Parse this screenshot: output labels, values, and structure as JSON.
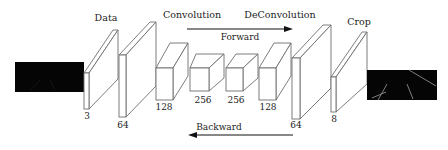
{
  "diagram": {
    "type": "encoder-decoder network architecture",
    "labels": {
      "data": "Data",
      "convolution": "Convolution",
      "deconvolution": "DeConvolution",
      "crop": "Crop"
    },
    "arrows": {
      "forward": "Forward",
      "backward": "Backward"
    },
    "layers": [
      {
        "id": "input-image",
        "kind": "image",
        "label": ""
      },
      {
        "id": "data-layer",
        "kind": "slab",
        "channels": "3"
      },
      {
        "id": "conv1",
        "kind": "slab",
        "channels": "64"
      },
      {
        "id": "conv2",
        "kind": "box",
        "channels": "128"
      },
      {
        "id": "conv3",
        "kind": "box",
        "channels": "256"
      },
      {
        "id": "deconv1",
        "kind": "box",
        "channels": "256"
      },
      {
        "id": "deconv2",
        "kind": "box",
        "channels": "128"
      },
      {
        "id": "deconv3",
        "kind": "slab",
        "channels": "64"
      },
      {
        "id": "crop-layer",
        "kind": "slab",
        "channels": "8"
      },
      {
        "id": "output-image",
        "kind": "image",
        "label": ""
      }
    ],
    "colors": {
      "stroke": "#6e6e6e",
      "image_fill": "#050505",
      "text": "#222222"
    }
  }
}
